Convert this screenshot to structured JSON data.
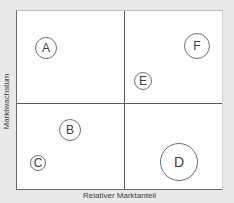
{
  "diagram": {
    "type": "portfolio-matrix",
    "x_axis_label": "Relativer Marktanteil",
    "y_axis_label": "Marktwachstum",
    "quadrants": 4,
    "bubbles": [
      {
        "label": "A",
        "cx": 46,
        "cy": 48,
        "r": 11
      },
      {
        "label": "F",
        "cx": 197,
        "cy": 46,
        "r": 13
      },
      {
        "label": "E",
        "cx": 143,
        "cy": 81,
        "r": 9
      },
      {
        "label": "B",
        "cx": 70,
        "cy": 130,
        "r": 11
      },
      {
        "label": "C",
        "cx": 38,
        "cy": 163,
        "r": 8
      },
      {
        "label": "D",
        "cx": 179,
        "cy": 162,
        "r": 19
      }
    ]
  },
  "colors": {
    "background": "#e9e9e9",
    "plot": "#ffffff",
    "lines": "#5a5a5a",
    "text": "#3c3c3c"
  }
}
